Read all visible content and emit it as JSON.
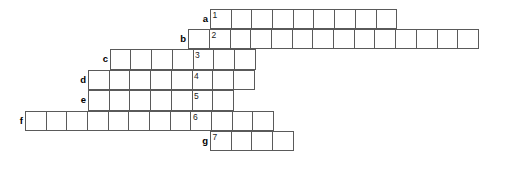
{
  "puzzle": {
    "title": "Crossword grid",
    "cell_width": 21.7,
    "cell_height": 20.4,
    "number_column_x": 210,
    "grid_top": 8.6,
    "border_color": "#5a5a5a",
    "cell_fill": "#ffffff",
    "text_color": "#1a1a1a",
    "rows": [
      {
        "letter": "a",
        "number": "1",
        "left": 210,
        "top": 8.6,
        "cells": 9,
        "number_index": 0,
        "label_left": 188,
        "cell_values": [
          "",
          "",
          "",
          "",
          "",
          "",
          "",
          "",
          ""
        ]
      },
      {
        "letter": "b",
        "number": "2",
        "left": 188.3,
        "top": 29.0,
        "cells": 14,
        "number_index": 1,
        "label_left": 166,
        "cell_values": [
          "",
          "",
          "",
          "",
          "",
          "",
          "",
          "",
          "",
          "",
          "",
          "",
          "",
          ""
        ]
      },
      {
        "letter": "c",
        "number": "3",
        "left": 109.8,
        "top": 49.4,
        "cells": 7,
        "number_index": 4,
        "label_left": 88,
        "cell_values": [
          "",
          "",
          "",
          "",
          "",
          "",
          ""
        ]
      },
      {
        "letter": "d",
        "number": "4",
        "left": 88.1,
        "top": 69.8,
        "cells": 8,
        "number_index": 5,
        "label_left": 66,
        "cell_values": [
          "",
          "",
          "",
          "",
          "",
          "",
          "",
          ""
        ]
      },
      {
        "letter": "e",
        "number": "5",
        "left": 88.1,
        "top": 90.2,
        "cells": 7,
        "number_index": 5,
        "label_left": 66,
        "cell_values": [
          "",
          "",
          "",
          "",
          "",
          "",
          ""
        ]
      },
      {
        "letter": "f",
        "number": "6",
        "left": 24.9,
        "top": 110.6,
        "cells": 12,
        "number_index": 8,
        "label_left": 3,
        "cell_values": [
          "",
          "",
          "",
          "",
          "",
          "",
          "",
          "",
          "",
          "",
          "",
          ""
        ]
      },
      {
        "letter": "g",
        "number": "7",
        "left": 210,
        "top": 131.0,
        "cells": 4,
        "number_index": 0,
        "label_left": 188,
        "cell_values": [
          "",
          "",
          "",
          ""
        ]
      }
    ]
  }
}
